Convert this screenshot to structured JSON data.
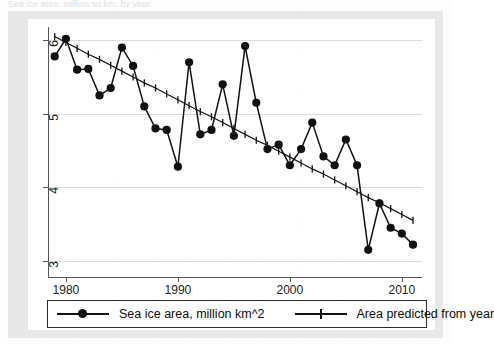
{
  "title_sliver": "Sea ice area, million sq km, by year",
  "legend": {
    "entries": [
      {
        "label": "Sea ice area, million km^2",
        "marker": "filled-circle",
        "color": "#111111"
      },
      {
        "label": "Area predicted from year",
        "marker": "plus",
        "color": "#111111"
      }
    ]
  },
  "chart_data": {
    "type": "line",
    "title": "",
    "xlabel": "Year",
    "ylabel": "",
    "xlim": [
      1978.4,
      2011.8
    ],
    "ylim": [
      2.78,
      6.18
    ],
    "xticks": [
      1980,
      1990,
      2000,
      2010
    ],
    "yticks": [
      3,
      4,
      5,
      6
    ],
    "grid": true,
    "legend_position": "below-plot",
    "x": [
      1979,
      1980,
      1981,
      1982,
      1983,
      1984,
      1985,
      1986,
      1987,
      1988,
      1989,
      1990,
      1991,
      1992,
      1993,
      1994,
      1995,
      1996,
      1997,
      1998,
      1999,
      2000,
      2001,
      2002,
      2003,
      2004,
      2005,
      2006,
      2007,
      2008,
      2009,
      2010,
      2011
    ],
    "series": [
      {
        "name": "Sea ice area, million km^2",
        "marker": "filled-circle",
        "color": "#111111",
        "values": [
          5.78,
          6.02,
          5.6,
          5.61,
          5.25,
          5.35,
          5.9,
          5.65,
          5.1,
          4.8,
          4.78,
          4.28,
          5.7,
          4.72,
          4.78,
          5.4,
          4.7,
          5.92,
          5.15,
          4.52,
          4.58,
          4.3,
          4.52,
          4.88,
          4.42,
          4.3,
          4.65,
          4.3,
          3.15,
          3.78,
          3.45,
          3.37,
          3.22
        ]
      },
      {
        "name": "Area predicted from year",
        "marker": "plus",
        "color": "#111111",
        "values": [
          6.05,
          5.97,
          5.89,
          5.81,
          5.74,
          5.66,
          5.58,
          5.5,
          5.42,
          5.35,
          5.27,
          5.19,
          5.11,
          5.03,
          4.96,
          4.88,
          4.8,
          4.72,
          4.64,
          4.57,
          4.49,
          4.41,
          4.33,
          4.25,
          4.18,
          4.1,
          4.02,
          3.94,
          3.86,
          3.79,
          3.71,
          3.63,
          3.55
        ]
      }
    ]
  }
}
